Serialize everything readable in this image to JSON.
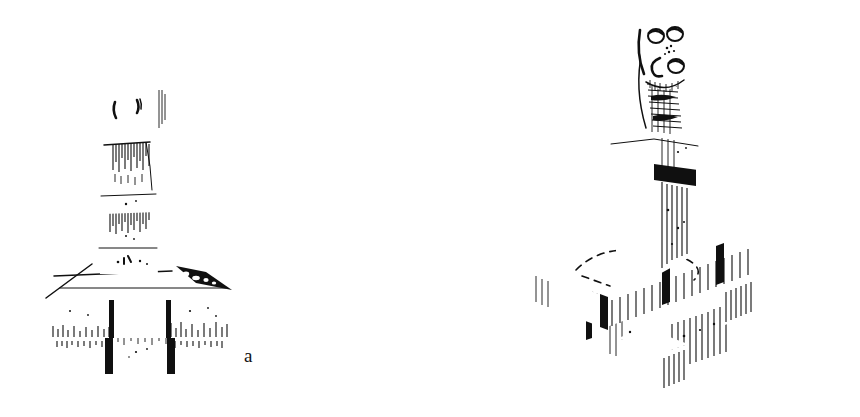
{
  "page": {
    "kind": "line-art-illustration",
    "background_color": "#ffffff",
    "ink_color": "#101010",
    "width_px": 860,
    "height_px": 417
  },
  "captions": {
    "figure_a_label": "a",
    "figure_b_label": "b"
  },
  "figures": [
    {
      "id": "figure-a",
      "label": "a",
      "view": "frontal / slight three-quarter from the left",
      "parts": [
        "block head with two incised eye marks",
        "tapering neck shaft with vertical shading",
        "upper collar block",
        "lower shaft segment",
        "lower collar block",
        "bevelled plinth cap with dark shaded right corner",
        "stepped rectangular base of stacked blocks"
      ],
      "bounding_box": {
        "x": 40,
        "y": 78,
        "width": 190,
        "height": 300
      }
    },
    {
      "id": "figure-b",
      "label": "b",
      "view": "three-quarter isometric from the left",
      "parts": [
        "tall curved hooded head carved with a face: two round eyes, dotted nose, round mouth forms",
        "long curved neck shaft with heavy cross-hatched shading",
        "upper moulded capital block",
        "dark recessed band",
        "square shaft pedestal",
        "square plinth top with dashed inscribed outline",
        "stepped isometric base of stacked blocks with corner projections"
      ],
      "bounding_box": {
        "x": 570,
        "y": 14,
        "width": 230,
        "height": 368
      }
    }
  ]
}
